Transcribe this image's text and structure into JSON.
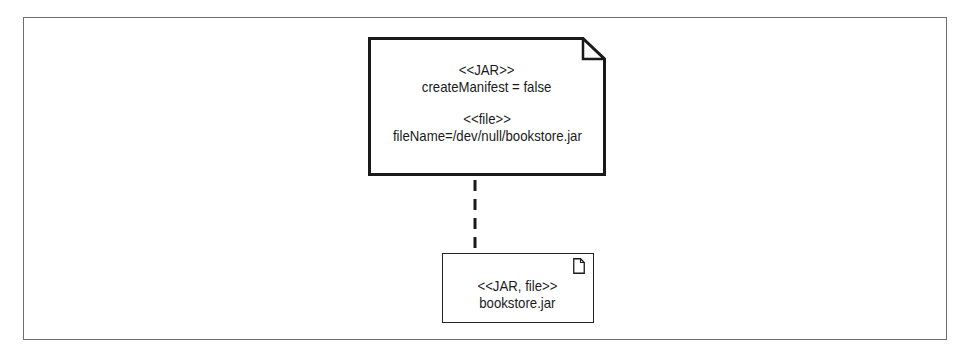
{
  "diagram": {
    "type": "UML deployment artifact diagram",
    "note": {
      "stereotype_1": "<<JAR>>",
      "property_1": "createManifest = false",
      "stereotype_2": "<<file>>",
      "property_2": "fileName=/dev/null/bookstore.jar"
    },
    "connector": {
      "style": "dashed"
    },
    "artifact": {
      "stereotype": "<<JAR, file>>",
      "name": "bookstore.jar",
      "icon": "file-icon"
    },
    "colors": {
      "frame_border": "#6e6e6e",
      "shape_stroke": "#1a1a1a",
      "background": "#ffffff",
      "text": "#1a1a1a"
    }
  }
}
